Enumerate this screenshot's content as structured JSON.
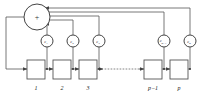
{
  "diagram": {
    "summing_junction": {
      "name": "summer",
      "symbol": "+",
      "cx": 37,
      "cy": 17,
      "r": 13
    },
    "coefficients": [
      {
        "id": "c1",
        "base": "c",
        "sub": "1",
        "cx": 47,
        "cy": 41,
        "r": 6.0
      },
      {
        "id": "c2",
        "base": "c",
        "sub": "2",
        "cx": 73,
        "cy": 41,
        "r": 6.0
      },
      {
        "id": "c3",
        "base": "c",
        "sub": "3",
        "cx": 99,
        "cy": 41,
        "r": 6.0
      },
      {
        "id": "cp1",
        "base": "c",
        "sub": "p-1",
        "cx": 164,
        "cy": 41,
        "r": 6.0
      },
      {
        "id": "cp",
        "base": "c",
        "sub": "p",
        "cx": 190,
        "cy": 41,
        "r": 6.0
      }
    ],
    "delay_boxes": [
      {
        "id": "box1",
        "label": "1",
        "x": 27,
        "y": 60,
        "w": 18,
        "h": 19
      },
      {
        "id": "box2",
        "label": "2",
        "x": 53,
        "y": 60,
        "w": 18,
        "h": 19
      },
      {
        "id": "box3",
        "label": "3",
        "x": 79,
        "y": 60,
        "w": 18,
        "h": 19
      },
      {
        "id": "boxp1",
        "label": "p-1",
        "x": 144,
        "y": 60,
        "w": 18,
        "h": 19
      },
      {
        "id": "boxp",
        "label": "p",
        "x": 170,
        "y": 60,
        "w": 18,
        "h": 19
      }
    ],
    "ellipsis": {
      "label": "......",
      "x1": 104,
      "x2": 140,
      "y": 69
    },
    "feedback_line_y": [
      10,
      14,
      18,
      22,
      26
    ],
    "colors": {
      "wire": "#555555",
      "node_stroke": "#444444",
      "box_stroke": "#555555",
      "text": "#222222",
      "background": "#ffffff"
    }
  }
}
